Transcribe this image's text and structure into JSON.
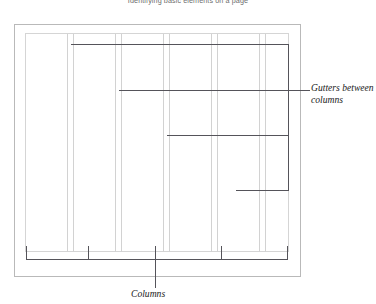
{
  "figure": {
    "top_caption": "Identifying basic elements on a page",
    "annotations": {
      "gutters": "Gutters between\ncolumns",
      "columns": "Columns"
    },
    "colors": {
      "page_border": "#b9b9b9",
      "grid_line": "#d2d2d2",
      "leader_line": "#55545a",
      "caption_text": "#6d6d6d",
      "annotation_text": "#222222",
      "background": "#ffffff"
    }
  },
  "diagram_data": {
    "type": "diagram",
    "subject": "page grid layout showing columns and gutters",
    "page_border": {
      "x": 14,
      "y": 24,
      "width": 287,
      "height": 253
    },
    "grid_area": {
      "x": 25,
      "y": 33,
      "width": 264,
      "height": 219
    },
    "column_count": 5,
    "gutter_count": 4,
    "column_edges_x": [
      25,
      67,
      73,
      115,
      121,
      163,
      169,
      211,
      217,
      259,
      265,
      289
    ],
    "gutter_centers_x": [
      70,
      118,
      166,
      214,
      262
    ],
    "bracket": {
      "y": 259,
      "x_start": 26,
      "x_end": 287,
      "tick_height": 14,
      "tick_positions_x": [
        26,
        88,
        155,
        221,
        287
      ]
    },
    "leader_lines": [
      {
        "name": "gutter-leader-top",
        "points": "73,44 288,44"
      },
      {
        "name": "gutter-leader-mid",
        "points": "124,90 288,90"
      },
      {
        "name": "gutter-leader-low",
        "points": "181,135 288,135"
      },
      {
        "name": "gutter-leader-bottom",
        "points": "235,190 288,190"
      },
      {
        "name": "gutter-leader-vertical",
        "points": "288,44 288,190"
      },
      {
        "name": "gutter-callout-stub",
        "points": "288,90 310,90"
      },
      {
        "name": "columns-callout-stub",
        "points": "155,259 155,287"
      }
    ]
  }
}
